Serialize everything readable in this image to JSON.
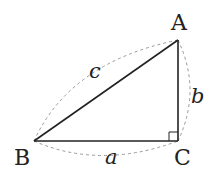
{
  "diagram": {
    "vertices": {
      "A": {
        "label": "A",
        "x": 178,
        "y": 40
      },
      "B": {
        "label": "B",
        "x": 34,
        "y": 141
      },
      "C": {
        "label": "C",
        "x": 178,
        "y": 141
      }
    },
    "sides": {
      "a": {
        "label": "a",
        "from": "B",
        "to": "C"
      },
      "b": {
        "label": "b",
        "from": "C",
        "to": "A"
      },
      "c": {
        "label": "c",
        "from": "B",
        "to": "A"
      }
    },
    "right_angle_at": "C",
    "colors": {
      "line": "#222222",
      "dashed": "#999999",
      "text": "#222222"
    }
  }
}
